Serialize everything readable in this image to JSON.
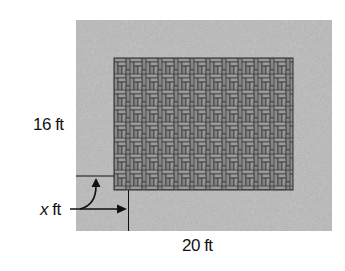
{
  "diagram": {
    "patio": {
      "pattern": "herringbone-brick",
      "fill_color": "#8a8a8a",
      "line_color": "#3a3a3a"
    },
    "border": {
      "fill_color": "#c4c4c4"
    },
    "labels": {
      "height": "16 ft",
      "width": "20 ft",
      "border_var": "x",
      "border_unit": "ft"
    }
  }
}
